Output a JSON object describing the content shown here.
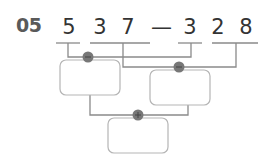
{
  "problem": {
    "number": "05",
    "digits": [
      "5",
      "3",
      "7",
      "—",
      "3",
      "2",
      "8"
    ],
    "left_operand_groups": [
      "5",
      "37"
    ],
    "right_operand_groups": [
      "3",
      "28"
    ]
  },
  "operators": {
    "first": "−",
    "second": "−",
    "combine": "+"
  },
  "boxes": [
    {
      "id": "box-left",
      "value": ""
    },
    {
      "id": "box-right",
      "value": ""
    },
    {
      "id": "box-result",
      "value": ""
    }
  ],
  "colors": {
    "line": "#8a8a8a",
    "box_border": "#b5b5b5",
    "dot": "#777777",
    "text": "#333333",
    "label": "#5a5a5a"
  }
}
